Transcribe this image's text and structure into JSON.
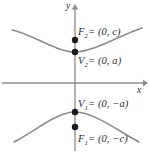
{
  "figure": {
    "type": "hyperbola-diagram",
    "orientation": "vertical",
    "colors": {
      "curve": "#8c8c8c",
      "axis": "#8c8c8c",
      "point": "#1a1a1a",
      "text": "#2b2b2b",
      "background": "#ffffff"
    }
  },
  "axes": {
    "x_label": "x",
    "y_label": "y",
    "origin": {
      "x": 75,
      "y": 83
    },
    "x_axis": {
      "x1": 2,
      "x2": 146,
      "y": 83,
      "arrow": "right"
    },
    "y_axis": {
      "y1": 5,
      "y2": 151,
      "x": 75,
      "arrow": "up"
    }
  },
  "labels": {
    "focus_upper": {
      "name": "F",
      "subscript": "2",
      "text": "= (0, c)"
    },
    "vertex_upper": {
      "name": "V",
      "subscript": "2",
      "text": "= (0, a)"
    },
    "vertex_lower": {
      "name": "V",
      "subscript": "1",
      "text": "= (0, −a)"
    },
    "focus_lower": {
      "name": "F",
      "subscript": "1",
      "text": "= (0, −c)"
    }
  },
  "points": [
    {
      "name": "focus-upper",
      "label": "F2",
      "cx": 75,
      "cy": 40,
      "r": 3.2
    },
    {
      "name": "vertex-upper",
      "label": "V2",
      "cx": 75,
      "cy": 52,
      "r": 3.2
    },
    {
      "name": "vertex-lower",
      "label": "V1",
      "cx": 75,
      "cy": 112,
      "r": 3.2
    },
    {
      "name": "focus-lower",
      "label": "F1",
      "cx": 75,
      "cy": 127,
      "r": 3.2
    }
  ],
  "chart_data": {
    "type": "line",
    "xlabel": "x",
    "ylabel": "y",
    "series": [
      {
        "name": "upper-branch",
        "path": "M 12,30 C 32,34 56,52 75,52 C 94,52 120,35 142,28"
      },
      {
        "name": "lower-branch",
        "path": "M 14,142 C 34,132 56,112 75,112 C 94,112 118,131 139,142"
      }
    ],
    "annotations": [
      "F2 = (0, c)",
      "V2 = (0, a)",
      "V1 = (0, -a)",
      "F1 = (0, -c)"
    ],
    "grid": false,
    "legend": "none"
  }
}
